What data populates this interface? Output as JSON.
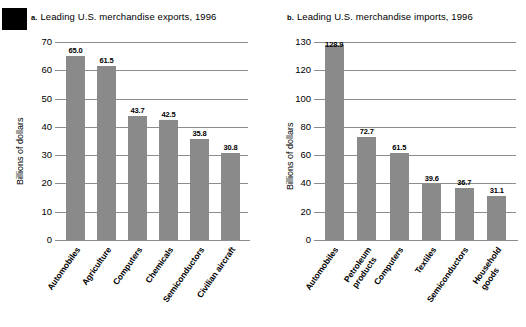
{
  "figure": {
    "marker_block": "black-callout-block"
  },
  "panels": [
    {
      "key": "exports",
      "letter": "a.",
      "title": "Leading U.S. merchandise exports, 1996",
      "ylabel": "Billions of dollars"
    },
    {
      "key": "imports",
      "letter": "b.",
      "title": "Leading U.S. merchandise imports, 1996",
      "ylabel": "Billions of dollars"
    }
  ],
  "chart_data": [
    {
      "type": "bar",
      "title": "Leading U.S. merchandise exports, 1996",
      "panel_letter": "a.",
      "xlabel": "",
      "ylabel": "Billions of dollars",
      "ylim": [
        0,
        70
      ],
      "yticks": [
        0,
        10,
        20,
        30,
        40,
        50,
        60,
        70
      ],
      "ytick_labels": [
        "0",
        "10",
        "20",
        "30",
        "40",
        "50",
        "60",
        "70"
      ],
      "grid": true,
      "legend": "none",
      "bar_color": "#8a8a8a",
      "categories": [
        "Automobiles",
        "Agriculture",
        "Computers",
        "Chemicals",
        "Semiconductors",
        "Civilian aircraft"
      ],
      "values": [
        65.0,
        61.5,
        43.7,
        42.5,
        35.8,
        30.8
      ],
      "value_labels": [
        "65.0",
        "61.5",
        "43.7",
        "42.5",
        "35.8",
        "30.8"
      ]
    },
    {
      "type": "bar",
      "title": "Leading U.S. merchandise imports, 1996",
      "panel_letter": "b.",
      "xlabel": "",
      "ylabel": "Billions of dollars",
      "ylim": [
        0,
        130
      ],
      "yticks": [
        0,
        20,
        40,
        60,
        80,
        100,
        120,
        130
      ],
      "ytick_labels": [
        "0",
        "20",
        "40",
        "60",
        "80",
        "100",
        "120",
        "130"
      ],
      "grid": true,
      "legend": "none",
      "bar_color": "#8a8a8a",
      "categories": [
        "Automobiles",
        "Petroleum products",
        "Computers",
        "Textiles",
        "Semiconductors",
        "Household goods"
      ],
      "category_lines": [
        [
          "Automobiles"
        ],
        [
          "Petroleum",
          "products"
        ],
        [
          "Computers"
        ],
        [
          "Textiles"
        ],
        [
          "Semiconductors"
        ],
        [
          "Household",
          "goods"
        ]
      ],
      "values": [
        128.9,
        72.7,
        61.5,
        39.6,
        36.7,
        31.1
      ],
      "value_labels": [
        "128.9",
        "72.7",
        "61.5",
        "39.6",
        "36.7",
        "31.1"
      ]
    }
  ]
}
